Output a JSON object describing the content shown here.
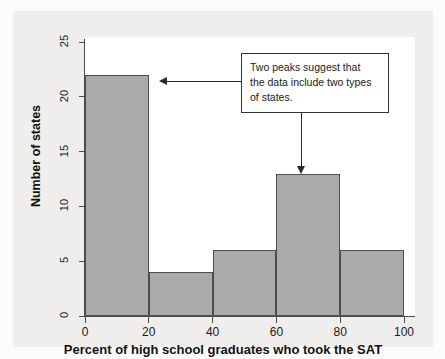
{
  "chart_data": {
    "type": "bar",
    "title": "",
    "subtitle": "",
    "xlabel": "Percent of high school graduates who took the SAT",
    "ylabel": "Number of states",
    "categories": [
      "0-20",
      "20-40",
      "40-60",
      "60-80",
      "80-100"
    ],
    "bin_edges": [
      0,
      20,
      40,
      60,
      80,
      100
    ],
    "values": [
      22,
      4,
      6,
      13,
      6
    ],
    "xlim": [
      0,
      100
    ],
    "ylim": [
      0,
      25
    ],
    "xticks": [
      "0",
      "20",
      "40",
      "60",
      "80",
      "100"
    ],
    "yticks": [
      "0",
      "5",
      "10",
      "15",
      "20",
      "25"
    ],
    "grid": false,
    "legend": false,
    "bar_fill_color": "#aaaaaa",
    "bar_edge_color": "#4d4d4d",
    "annotations": [
      {
        "name": "two-peaks-callout",
        "lines": [
          "Two peaks suggest that",
          "the data include two types",
          "of states."
        ],
        "text": "Two peaks suggest that the data include two types of states.",
        "points_to": [
          "bar 0-20 (height 22)",
          "bar 60-80 (height 13)"
        ]
      }
    ]
  },
  "axes": {
    "y_title": "Number of states",
    "x_title": "Percent of high school graduates who took the SAT",
    "y_ticks": [
      {
        "label": "0",
        "value": 0
      },
      {
        "label": "5",
        "value": 5
      },
      {
        "label": "10",
        "value": 10
      },
      {
        "label": "15",
        "value": 15
      },
      {
        "label": "20",
        "value": 20
      },
      {
        "label": "25",
        "value": 25
      }
    ],
    "x_ticks": [
      {
        "label": "0",
        "value": 0
      },
      {
        "label": "20",
        "value": 20
      },
      {
        "label": "40",
        "value": 40
      },
      {
        "label": "60",
        "value": 60
      },
      {
        "label": "80",
        "value": 80
      },
      {
        "label": "100",
        "value": 100
      }
    ]
  },
  "callout": {
    "line1": "Two peaks suggest that",
    "line2": "the data include two types",
    "line3": "of states."
  }
}
